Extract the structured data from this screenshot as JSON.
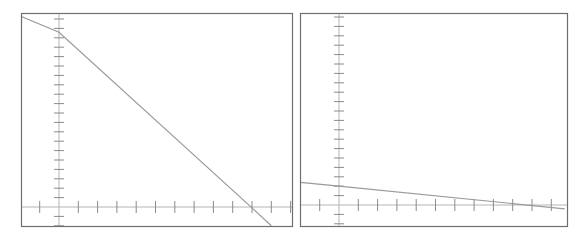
{
  "chart_data": [
    {
      "type": "line",
      "title": "",
      "xlabel": "",
      "ylabel": "",
      "grid": false,
      "legend": null,
      "frame": {
        "x": 21,
        "y": 13,
        "w": 271,
        "h": 213
      },
      "origin": {
        "x": 59,
        "y": 207
      },
      "tick_spacing": {
        "x": 19.3,
        "y": 9.4
      },
      "x_ticks": [
        -2,
        -1,
        0,
        1,
        2,
        3,
        4,
        5,
        6,
        7,
        8,
        9,
        10,
        11,
        12
      ],
      "y_ticks": [
        -2,
        -1,
        0,
        1,
        2,
        3,
        4,
        5,
        6,
        7,
        8,
        9,
        10,
        11,
        12,
        13,
        14,
        15,
        16,
        17,
        18,
        19,
        20
      ],
      "series": [
        {
          "name": "line",
          "color": "#9a9a9a",
          "x": [
            -2,
            0,
            10,
            11
          ],
          "y": [
            20.3,
            18.6,
            -0.1,
            -2.0
          ]
        }
      ]
    },
    {
      "type": "line",
      "title": "",
      "xlabel": "",
      "ylabel": "",
      "grid": false,
      "legend": null,
      "frame": {
        "x": 300,
        "y": 13,
        "w": 267,
        "h": 213
      },
      "origin": {
        "x": 339,
        "y": 205
      },
      "tick_spacing": {
        "x": 19.3,
        "y": 9.4
      },
      "x_ticks": [
        -2,
        -1,
        0,
        1,
        2,
        3,
        4,
        5,
        6,
        7,
        8,
        9,
        10,
        11,
        12
      ],
      "y_ticks": [
        -2,
        -1,
        0,
        1,
        2,
        3,
        4,
        5,
        6,
        7,
        8,
        9,
        10,
        11,
        12,
        13,
        14,
        15,
        16,
        17,
        18,
        19,
        20
      ],
      "series": [
        {
          "name": "line",
          "color": "#9a9a9a",
          "x": [
            -2,
            0,
            11.7
          ],
          "y": [
            2.4,
            2.0,
            -0.4
          ]
        }
      ]
    }
  ]
}
